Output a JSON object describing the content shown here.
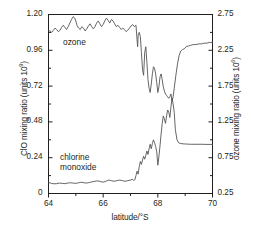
{
  "chart_data": {
    "type": "line",
    "title": "",
    "xlabel": "latitude/°S",
    "xlim": [
      64,
      70
    ],
    "xticks": [
      64,
      66,
      68,
      70
    ],
    "xminor": [
      65,
      67,
      69
    ],
    "grid": false,
    "legend_position": "inline-annotation",
    "axes": [
      {
        "id": "left",
        "ylabel": "ClO mixing ratio (units 10",
        "ylabel_exponent": "9",
        "ylabel_suffix": ")",
        "ylim": [
          0,
          1.2
        ],
        "yticks": [
          0,
          0.24,
          0.48,
          0.72,
          0.96,
          1.2
        ],
        "yticklabels": [
          "0",
          "0.24",
          "0.48",
          "0.72",
          "0.96",
          "1.20"
        ],
        "yminor": [
          0.12,
          0.36,
          0.6,
          0.84,
          1.08
        ]
      },
      {
        "id": "right",
        "ylabel": "ozone mixing ratio (units 10",
        "ylabel_exponent": "6",
        "ylabel_suffix": ")",
        "ylim": [
          0.25,
          2.75
        ],
        "yticks": [
          0.25,
          0.75,
          1.25,
          1.75,
          2.25,
          2.75
        ],
        "yticklabels": [
          "0.25",
          "0.75",
          "1.25",
          "1.75",
          "2.25",
          "2.75"
        ],
        "yminor": [
          0.5,
          1.0,
          1.5,
          2.0,
          2.5
        ]
      }
    ],
    "series": [
      {
        "name": "ozone",
        "label": "ozone",
        "axis": "right",
        "color": "#555555",
        "x": [
          64.0,
          64.06,
          64.12,
          64.18,
          64.24,
          64.3,
          64.36,
          64.42,
          64.48,
          64.54,
          64.6,
          64.66,
          64.72,
          64.78,
          64.84,
          64.9,
          64.96,
          65.0,
          65.04,
          65.1,
          65.16,
          65.22,
          65.28,
          65.34,
          65.4,
          65.46,
          65.52,
          65.58,
          65.64,
          65.7,
          65.76,
          65.82,
          65.88,
          65.94,
          66.0,
          66.06,
          66.12,
          66.18,
          66.24,
          66.3,
          66.36,
          66.42,
          66.48,
          66.54,
          66.6,
          66.66,
          66.72,
          66.78,
          66.84,
          66.9,
          66.96,
          67.02,
          67.08,
          67.14,
          67.2,
          67.24,
          67.26,
          67.28,
          67.32,
          67.36,
          67.4,
          67.44,
          67.48,
          67.52,
          67.56,
          67.6,
          67.64,
          67.68,
          67.72,
          67.76,
          67.8,
          67.84,
          67.88,
          67.92,
          67.96,
          68.0,
          68.04,
          68.08,
          68.12,
          68.16,
          68.2,
          68.24,
          68.28,
          68.32,
          68.36,
          68.4,
          68.44,
          68.48,
          68.52,
          68.56,
          68.6,
          68.66,
          68.72,
          68.78,
          68.84,
          68.9,
          68.96,
          69.04,
          69.12,
          69.2,
          69.3,
          69.4,
          69.5,
          69.6,
          69.7,
          69.8,
          69.9,
          70.0
        ],
        "y": [
          2.52,
          2.52,
          2.5,
          2.53,
          2.56,
          2.54,
          2.51,
          2.53,
          2.57,
          2.6,
          2.57,
          2.54,
          2.58,
          2.63,
          2.68,
          2.72,
          2.7,
          2.66,
          2.6,
          2.56,
          2.54,
          2.58,
          2.56,
          2.52,
          2.55,
          2.59,
          2.62,
          2.58,
          2.55,
          2.58,
          2.63,
          2.66,
          2.62,
          2.58,
          2.61,
          2.66,
          2.7,
          2.67,
          2.63,
          2.68,
          2.66,
          2.62,
          2.58,
          2.6,
          2.57,
          2.54,
          2.56,
          2.54,
          2.51,
          2.53,
          2.56,
          2.59,
          2.61,
          2.58,
          2.6,
          2.4,
          2.3,
          2.46,
          2.5,
          2.44,
          2.22,
          1.98,
          1.9,
          2.22,
          2.3,
          2.08,
          1.84,
          1.72,
          1.66,
          1.78,
          1.92,
          2.02,
          2.0,
          1.92,
          1.8,
          1.66,
          1.74,
          1.88,
          1.92,
          1.84,
          1.74,
          1.68,
          1.64,
          1.62,
          1.6,
          1.58,
          1.6,
          1.64,
          1.54,
          1.6,
          1.72,
          1.9,
          2.06,
          2.18,
          2.24,
          2.26,
          2.27,
          2.3,
          2.31,
          2.32,
          2.33,
          2.33,
          2.34,
          2.34,
          2.35,
          2.35,
          2.36,
          2.36
        ]
      },
      {
        "name": "chlorine monoxide",
        "label": "chlorine monoxide",
        "axis": "left",
        "color": "#555555",
        "x": [
          64.0,
          64.1,
          64.2,
          64.3,
          64.4,
          64.5,
          64.6,
          64.7,
          64.8,
          64.9,
          65.0,
          65.1,
          65.2,
          65.3,
          65.4,
          65.5,
          65.6,
          65.7,
          65.8,
          65.9,
          66.0,
          66.1,
          66.2,
          66.3,
          66.4,
          66.5,
          66.6,
          66.7,
          66.8,
          66.9,
          67.0,
          67.06,
          67.12,
          67.16,
          67.2,
          67.24,
          67.28,
          67.32,
          67.36,
          67.4,
          67.44,
          67.48,
          67.52,
          67.56,
          67.6,
          67.64,
          67.68,
          67.72,
          67.76,
          67.8,
          67.84,
          67.88,
          67.92,
          67.96,
          68.0,
          68.04,
          68.08,
          68.12,
          68.16,
          68.2,
          68.24,
          68.28,
          68.32,
          68.36,
          68.4,
          68.44,
          68.48,
          68.52,
          68.56,
          68.6,
          68.64,
          68.7,
          68.76,
          68.84,
          68.92,
          69.0,
          69.1,
          69.2,
          69.4,
          69.6,
          69.8,
          70.0
        ],
        "y": [
          0.075,
          0.068,
          0.065,
          0.066,
          0.07,
          0.068,
          0.066,
          0.07,
          0.072,
          0.07,
          0.068,
          0.072,
          0.075,
          0.072,
          0.07,
          0.074,
          0.078,
          0.082,
          0.085,
          0.08,
          0.076,
          0.082,
          0.09,
          0.086,
          0.082,
          0.086,
          0.09,
          0.086,
          0.082,
          0.086,
          0.09,
          0.095,
          0.088,
          0.092,
          0.12,
          0.15,
          0.13,
          0.18,
          0.215,
          0.195,
          0.225,
          0.25,
          0.23,
          0.255,
          0.285,
          0.262,
          0.3,
          0.33,
          0.3,
          0.335,
          0.36,
          0.34,
          0.315,
          0.28,
          0.19,
          0.25,
          0.32,
          0.4,
          0.47,
          0.52,
          0.5,
          0.47,
          0.52,
          0.56,
          0.545,
          0.51,
          0.58,
          0.64,
          0.6,
          0.545,
          0.43,
          0.36,
          0.34,
          0.335,
          0.333,
          0.332,
          0.331,
          0.33,
          0.33,
          0.33,
          0.329,
          0.329
        ]
      }
    ]
  },
  "ticks": {
    "left": [
      "1.20",
      "0.96",
      "0.72",
      "0.48",
      "0.24",
      "0"
    ],
    "right": [
      "2.75",
      "2.25",
      "1.75",
      "1.25",
      "0.75",
      "0.25"
    ],
    "bottom": [
      "64",
      "66",
      "68",
      "70"
    ]
  },
  "labels": {
    "ozone": "ozone",
    "chlorine_line1": "chlorine",
    "chlorine_line2": "monoxide",
    "ylabel_left_pre": "ClO mixing ratio (units 10",
    "ylabel_left_exp": "9",
    "ylabel_left_post": ")",
    "ylabel_right_pre": "ozone mixing ratio (units 10",
    "ylabel_right_exp": "6",
    "ylabel_right_post": ")",
    "xlabel": "latitude/°S"
  },
  "colors": {
    "background": "#ffffff",
    "axis": "#231f20",
    "line": "#555555"
  }
}
